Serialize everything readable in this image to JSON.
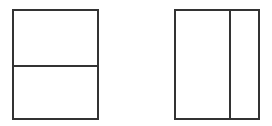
{
  "diagram": {
    "stroke_color": "#333333",
    "background": "#ffffff",
    "shapes": [
      {
        "id": "left-rectangle",
        "division": "horizontal",
        "x": 12,
        "y": 9,
        "width": 87,
        "height": 111,
        "divider_offset": 55
      },
      {
        "id": "right-rectangle",
        "division": "vertical",
        "x": 174,
        "y": 9,
        "width": 86,
        "height": 111,
        "divider_offset": 54
      }
    ]
  }
}
